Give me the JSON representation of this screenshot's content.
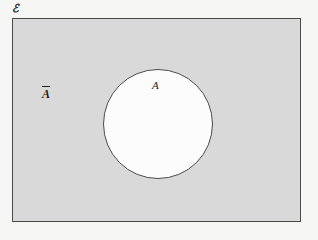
{
  "figure": {
    "type": "venn-diagram",
    "universal_set": {
      "label": "ℰ",
      "icon": "rectangle-outline",
      "shape": "rectangle",
      "fill_color": "#d9d9d9",
      "stroke_color": "#4a4a4a",
      "shaded": true
    },
    "set_a": {
      "label": "A",
      "icon": "circle-outline",
      "shape": "circle",
      "fill_color": "#fcfcfc",
      "stroke_color": "#4a4a4a",
      "shaded": false
    },
    "complement_region": {
      "label": "A",
      "overbar": true,
      "meaning": "complement of A",
      "shaded": true,
      "fill_color": "#d9d9d9"
    },
    "background_color": "#f6f6f4"
  }
}
